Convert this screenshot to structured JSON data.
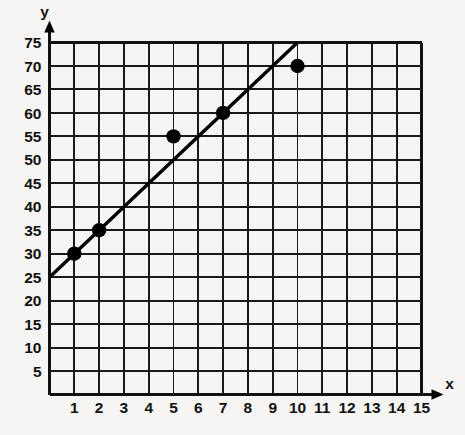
{
  "chart_data": {
    "type": "scatter",
    "title": "",
    "subtitle": "",
    "xlabel": "x",
    "ylabel": "y",
    "xlim": [
      0,
      15
    ],
    "ylim": [
      0,
      75
    ],
    "grid": true,
    "legend": false,
    "x_ticks": [
      1,
      2,
      3,
      4,
      5,
      6,
      7,
      8,
      9,
      10,
      11,
      12,
      13,
      14,
      15
    ],
    "x_tick_labels": [
      "1",
      "2",
      "3",
      "4",
      "5",
      "6",
      "7",
      "8",
      "9",
      "10",
      "11",
      "12",
      "13",
      "14",
      "15"
    ],
    "y_ticks": [
      5,
      10,
      15,
      20,
      25,
      30,
      35,
      40,
      45,
      50,
      55,
      60,
      65,
      70,
      75
    ],
    "y_tick_labels": [
      "5",
      "10",
      "15",
      "20",
      "25",
      "30",
      "35",
      "40",
      "45",
      "50",
      "55",
      "60",
      "65",
      "70",
      "75"
    ],
    "x_major_step": 1,
    "y_major_step": 5,
    "series": [
      {
        "name": "data points",
        "type": "scatter",
        "marker": "filled-circle",
        "color": "#000000",
        "points": [
          {
            "x": 1,
            "y": 30
          },
          {
            "x": 2,
            "y": 35
          },
          {
            "x": 5,
            "y": 55
          },
          {
            "x": 7,
            "y": 60
          },
          {
            "x": 10,
            "y": 70
          }
        ]
      },
      {
        "name": "line of best fit",
        "type": "line",
        "color": "#000000",
        "intercept": 25,
        "slope": 5,
        "x_start": 0,
        "y_start": 25,
        "x_end": 10,
        "y_end": 75
      }
    ],
    "axis_arrows": {
      "x": true,
      "y": true
    }
  },
  "labels": {
    "y_axis": "y",
    "x_axis": "x"
  }
}
